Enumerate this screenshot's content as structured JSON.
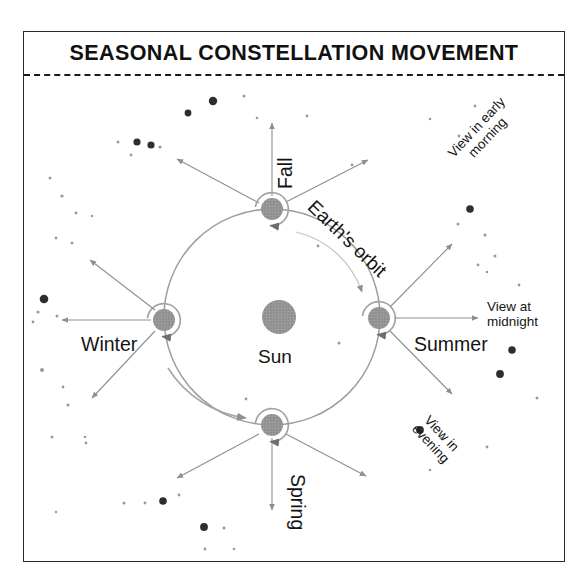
{
  "figure": {
    "title": "SEASONAL CONSTELLATION MOVEMENT",
    "type": "astronomy-diagram",
    "background_color": "#ffffff",
    "frame_color": "#2a2a2a",
    "sun_color": "#8c8c8c",
    "earth_color": "#8a8a8a",
    "orbit_color": "#9a9a9a",
    "arrow_color": "#8f8f8f",
    "text_color": "#141414"
  },
  "labels": {
    "sun": "Sun",
    "orbit": "Earth's orbit",
    "seasons": {
      "fall": "Fall",
      "winter": "Winter",
      "spring": "Spring",
      "summer": "Summer"
    },
    "views": {
      "early_morning": "View in early morning",
      "early_morning_line1": "View in early",
      "early_morning_line2": "morning",
      "midnight": "View at midnight",
      "midnight_line1": "View at",
      "midnight_line2": "midnight",
      "evening": "View in evening",
      "evening_line1": "View in",
      "evening_line2": "evening"
    }
  },
  "chart_data": {
    "type": "scatter",
    "title": "SEASONAL CONSTELLATION MOVEMENT",
    "xlabel": "",
    "ylabel": "",
    "sun": {
      "cx": 279,
      "cy": 317,
      "r": 17,
      "label": "Sun"
    },
    "orbit": {
      "cx": 272,
      "cy": 317,
      "rx": 108,
      "ry": 108,
      "label": "Earth's orbit"
    },
    "earth_positions": [
      {
        "season": "Fall",
        "cx": 272,
        "cy": 209,
        "r": 11,
        "spin": "counterclockwise"
      },
      {
        "season": "Winter",
        "cx": 164,
        "cy": 320,
        "r": 11,
        "spin": "counterclockwise"
      },
      {
        "season": "Spring",
        "cx": 272,
        "cy": 425,
        "r": 11,
        "spin": "counterclockwise"
      },
      {
        "season": "Summer",
        "cx": 379,
        "cy": 318,
        "r": 11,
        "spin": "counterclockwise"
      }
    ],
    "sight_line_arrows": [
      {
        "from": "Fall",
        "x1": 272,
        "y1": 196,
        "x2": 272,
        "y2": 123,
        "note": "Fall up"
      },
      {
        "from": "Fall",
        "x1": 259,
        "y1": 203,
        "x2": 177,
        "y2": 159,
        "note": "Fall upper-left"
      },
      {
        "from": "Fall",
        "x1": 286,
        "y1": 202,
        "x2": 368,
        "y2": 160,
        "note": "Fall upper-right"
      },
      {
        "from": "Winter",
        "x1": 151,
        "y1": 320,
        "x2": 62,
        "y2": 320,
        "note": "Winter left"
      },
      {
        "from": "Winter",
        "x1": 155,
        "y1": 310,
        "x2": 90,
        "y2": 260,
        "note": "Winter upper-left"
      },
      {
        "from": "Winter",
        "x1": 155,
        "y1": 331,
        "x2": 92,
        "y2": 398,
        "note": "Winter lower-left"
      },
      {
        "from": "Spring",
        "x1": 272,
        "y1": 438,
        "x2": 272,
        "y2": 510,
        "note": "Spring down"
      },
      {
        "from": "Spring",
        "x1": 259,
        "y1": 434,
        "x2": 177,
        "y2": 478,
        "note": "Spring lower-left"
      },
      {
        "from": "Spring",
        "x1": 286,
        "y1": 434,
        "x2": 366,
        "y2": 476,
        "note": "Spring lower-right"
      },
      {
        "from": "Summer",
        "x1": 394,
        "y1": 318,
        "x2": 478,
        "y2": 318,
        "note": "View at midnight"
      },
      {
        "from": "Summer",
        "x1": 390,
        "y1": 307,
        "x2": 452,
        "y2": 244,
        "note": "View in early morning"
      },
      {
        "from": "Summer",
        "x1": 390,
        "y1": 331,
        "x2": 452,
        "y2": 394,
        "note": "View in evening"
      }
    ],
    "stars": [
      {
        "x": 213,
        "y": 101,
        "r": 4.2
      },
      {
        "x": 244,
        "y": 96,
        "r": 1.5
      },
      {
        "x": 188,
        "y": 113,
        "r": 3.4
      },
      {
        "x": 257,
        "y": 118,
        "r": 1.3
      },
      {
        "x": 307,
        "y": 116,
        "r": 1.4
      },
      {
        "x": 137,
        "y": 142,
        "r": 3.6
      },
      {
        "x": 160,
        "y": 147,
        "r": 1.6
      },
      {
        "x": 151,
        "y": 145,
        "r": 3.6
      },
      {
        "x": 118,
        "y": 142,
        "r": 1.5
      },
      {
        "x": 131,
        "y": 155,
        "r": 1.4
      },
      {
        "x": 50,
        "y": 178,
        "r": 1.5
      },
      {
        "x": 62,
        "y": 196,
        "r": 1.6
      },
      {
        "x": 76,
        "y": 213,
        "r": 1.4
      },
      {
        "x": 92,
        "y": 216,
        "r": 1.3
      },
      {
        "x": 56,
        "y": 238,
        "r": 1.4
      },
      {
        "x": 72,
        "y": 243,
        "r": 1.5
      },
      {
        "x": 44,
        "y": 299,
        "r": 4.3
      },
      {
        "x": 38,
        "y": 312,
        "r": 1.6
      },
      {
        "x": 57,
        "y": 316,
        "r": 1.5
      },
      {
        "x": 33,
        "y": 322,
        "r": 1.4
      },
      {
        "x": 42,
        "y": 370,
        "r": 2.0
      },
      {
        "x": 63,
        "y": 387,
        "r": 1.4
      },
      {
        "x": 68,
        "y": 405,
        "r": 1.6
      },
      {
        "x": 52,
        "y": 437,
        "r": 1.5
      },
      {
        "x": 86,
        "y": 443,
        "r": 1.4
      },
      {
        "x": 85,
        "y": 437,
        "r": 1.3
      },
      {
        "x": 56,
        "y": 512,
        "r": 1.3
      },
      {
        "x": 124,
        "y": 503,
        "r": 1.5
      },
      {
        "x": 145,
        "y": 503,
        "r": 1.4
      },
      {
        "x": 163,
        "y": 501,
        "r": 3.8
      },
      {
        "x": 204,
        "y": 527,
        "r": 3.9
      },
      {
        "x": 224,
        "y": 528,
        "r": 1.5
      },
      {
        "x": 205,
        "y": 549,
        "r": 1.4
      },
      {
        "x": 234,
        "y": 549,
        "r": 1.3
      },
      {
        "x": 179,
        "y": 495,
        "r": 1.4
      },
      {
        "x": 430,
        "y": 119,
        "r": 1.3
      },
      {
        "x": 459,
        "y": 136,
        "r": 1.4
      },
      {
        "x": 475,
        "y": 106,
        "r": 1.4
      },
      {
        "x": 470,
        "y": 209,
        "r": 3.8
      },
      {
        "x": 458,
        "y": 224,
        "r": 1.5
      },
      {
        "x": 485,
        "y": 235,
        "r": 1.6
      },
      {
        "x": 495,
        "y": 256,
        "r": 1.5
      },
      {
        "x": 478,
        "y": 265,
        "r": 1.4
      },
      {
        "x": 487,
        "y": 272,
        "r": 1.3
      },
      {
        "x": 519,
        "y": 285,
        "r": 1.4
      },
      {
        "x": 512,
        "y": 350,
        "r": 3.8
      },
      {
        "x": 500,
        "y": 374,
        "r": 3.9
      },
      {
        "x": 537,
        "y": 398,
        "r": 1.5
      },
      {
        "x": 487,
        "y": 447,
        "r": 1.4
      },
      {
        "x": 420,
        "y": 430,
        "r": 3.9
      },
      {
        "x": 441,
        "y": 438,
        "r": 1.5
      },
      {
        "x": 430,
        "y": 470,
        "r": 1.3
      },
      {
        "x": 352,
        "y": 165,
        "r": 1.4
      },
      {
        "x": 318,
        "y": 246,
        "r": 1.4
      },
      {
        "x": 339,
        "y": 343,
        "r": 1.5
      },
      {
        "x": 246,
        "y": 399,
        "r": 1.4
      }
    ]
  }
}
